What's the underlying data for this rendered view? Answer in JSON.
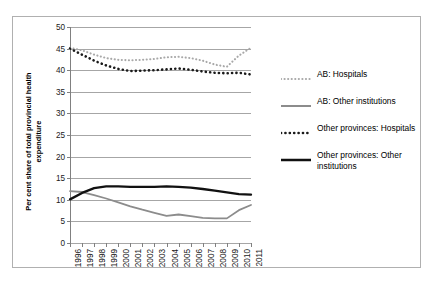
{
  "chart_data": {
    "type": "line",
    "title": "",
    "xlabel": "",
    "ylabel": "Per cent share of total provincial health expenditure",
    "ylabel_lines": [
      "Per cent share of total provincial health",
      "expenditure"
    ],
    "grid": "horizontal",
    "legend_position": "right",
    "xlim": [
      1996,
      2011
    ],
    "ylim": [
      0,
      50
    ],
    "ytick_step": 5,
    "yticks": [
      0,
      5,
      10,
      15,
      20,
      25,
      30,
      35,
      40,
      45,
      50
    ],
    "categories": [
      1996,
      1997,
      1998,
      1999,
      2000,
      2001,
      2002,
      2003,
      2004,
      2005,
      2006,
      2007,
      2008,
      2009,
      2010,
      2011
    ],
    "xtick_labels": [
      "1996",
      "1997",
      "1998",
      "1999",
      "2000",
      "2001",
      "2002",
      "2003",
      "2004",
      "2005",
      "2006",
      "2007",
      "2008",
      "2009",
      "2010",
      "2011"
    ],
    "series": [
      {
        "name": "AB: Hospitals",
        "style": "dotted",
        "color": "#a8a8a8",
        "width": 2.1,
        "values": [
          45.2,
          44.6,
          43.6,
          42.8,
          42.4,
          42.3,
          42.4,
          42.6,
          43.0,
          43.1,
          42.8,
          42.2,
          41.3,
          40.8,
          43.4,
          45.2
        ]
      },
      {
        "name": "AB: Other institutions",
        "style": "solid",
        "color": "#8c8c8c",
        "width": 1.8,
        "values": [
          12.0,
          11.8,
          11.1,
          10.3,
          9.4,
          8.5,
          7.7,
          7.0,
          6.3,
          6.6,
          6.2,
          5.8,
          5.7,
          5.7,
          7.6,
          8.8
        ]
      },
      {
        "name": "Other provinces: Hospitals",
        "style": "dotted",
        "color": "#1a1a1a",
        "width": 2.6,
        "values": [
          45.0,
          43.6,
          42.2,
          41.1,
          40.3,
          39.8,
          39.9,
          40.0,
          40.2,
          40.4,
          40.1,
          39.7,
          39.4,
          39.3,
          39.4,
          39.0
        ]
      },
      {
        "name": "Other provinces: Other institutions",
        "style": "solid",
        "color": "#111111",
        "width": 2.3,
        "values": [
          10.1,
          11.6,
          12.7,
          13.1,
          13.1,
          13.0,
          13.0,
          13.0,
          13.1,
          13.0,
          12.8,
          12.5,
          12.1,
          11.7,
          11.3,
          11.2
        ]
      }
    ]
  },
  "legend": {
    "entries": [
      {
        "label": "AB: Hospitals"
      },
      {
        "label": "AB: Other institutions"
      },
      {
        "label": "Other provinces: Hospitals"
      },
      {
        "label": "Other provinces: Other institutions"
      }
    ]
  }
}
